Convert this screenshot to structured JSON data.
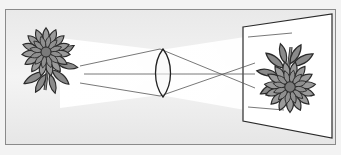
{
  "diagram": {
    "title": "Convex lens forming an inverted real image on a screen",
    "elements": {
      "object": "flower (object)",
      "lens": "convex lens",
      "screen": "projection screen",
      "image": "inverted flower (image)",
      "rays": "light rays"
    },
    "colors": {
      "background": "#ededed",
      "frame": "#8a8a8a",
      "light_cone": "#ffffff",
      "petal_fill": "#8f8f8f",
      "leaf_fill": "#8a8a8a",
      "outline": "#2a2a2a",
      "center_fill": "#7a7a7a",
      "screen_fill": "#ffffff"
    }
  }
}
